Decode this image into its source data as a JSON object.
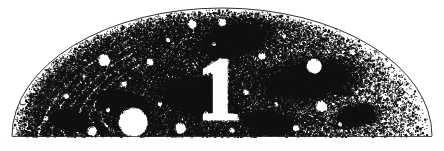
{
  "figure": {
    "kind": "half-disc-stipple-engraving",
    "label": "1",
    "label_style": "serif-numeral-white-knockout",
    "corner_mark": "~~~",
    "background_color": "#fdfdfb",
    "ink_color": "#111111",
    "paper_color": "#ffffff",
    "canvas": {
      "width": 444,
      "height": 151
    }
  },
  "chart_data": {
    "type": "scatter",
    "title": "",
    "xlabel": "",
    "ylabel": "",
    "grid": false,
    "legend": null,
    "xlim": [
      0,
      444
    ],
    "ylim": [
      0,
      151
    ],
    "shape": {
      "type": "half-disc",
      "center_x": 222,
      "baseline_y": 136,
      "radius_x": 210,
      "radius_y": 128,
      "outline_stroke": "#1a1a1a",
      "outline_width": 0.9
    },
    "density_field": {
      "description": "Ink coverage fraction by normalized horizontal position across the plate",
      "x": [
        0.0,
        0.1,
        0.2,
        0.3,
        0.4,
        0.5,
        0.6,
        0.7,
        0.8,
        0.9,
        1.0
      ],
      "values": [
        0.62,
        0.78,
        0.86,
        0.9,
        0.88,
        0.8,
        0.66,
        0.5,
        0.33,
        0.18,
        0.07
      ]
    },
    "swirl_bands": {
      "description": "Concentric lens-shaped arc bands in the upper-left quadrant",
      "count": 6,
      "origin_x": 150,
      "origin_y": 96,
      "rotation_deg": -29,
      "radii": [
        44,
        58,
        72,
        86,
        100,
        114
      ],
      "band_width": 6.5,
      "arc_start_deg": 150,
      "arc_end_deg": 268
    },
    "dark_lobes": [
      {
        "cx": 232,
        "cy": 40,
        "rx": 40,
        "ry": 19,
        "rot": -12
      },
      {
        "cx": 196,
        "cy": 96,
        "rx": 44,
        "ry": 22,
        "rot": 8
      },
      {
        "cx": 306,
        "cy": 80,
        "rx": 52,
        "ry": 21,
        "rot": -7
      },
      {
        "cx": 122,
        "cy": 104,
        "rx": 34,
        "ry": 17,
        "rot": 16
      },
      {
        "cx": 268,
        "cy": 122,
        "rx": 30,
        "ry": 13,
        "rot": 5
      },
      {
        "cx": 356,
        "cy": 116,
        "rx": 22,
        "ry": 11,
        "rot": -9
      },
      {
        "cx": 70,
        "cy": 120,
        "rx": 26,
        "ry": 12,
        "rot": 12
      }
    ],
    "white_discs": [
      {
        "cx": 133,
        "cy": 122,
        "r": 14.5
      },
      {
        "cx": 314,
        "cy": 66,
        "r": 7.5
      },
      {
        "cx": 104,
        "cy": 60,
        "r": 6.0
      },
      {
        "cx": 180,
        "cy": 128,
        "r": 5.5
      },
      {
        "cx": 321,
        "cy": 106,
        "r": 5.5
      },
      {
        "cx": 192,
        "cy": 24,
        "r": 4.5
      },
      {
        "cx": 222,
        "cy": 22,
        "r": 4.0
      },
      {
        "cx": 92,
        "cy": 131,
        "r": 4.8
      },
      {
        "cx": 262,
        "cy": 56,
        "r": 3.6
      },
      {
        "cx": 150,
        "cy": 62,
        "r": 3.4
      },
      {
        "cx": 352,
        "cy": 52,
        "r": 3.0
      },
      {
        "cx": 246,
        "cy": 92,
        "r": 2.8
      },
      {
        "cx": 296,
        "cy": 128,
        "r": 3.2
      },
      {
        "cx": 66,
        "cy": 96,
        "r": 2.6
      },
      {
        "cx": 206,
        "cy": 114,
        "r": 2.4
      },
      {
        "cx": 168,
        "cy": 40,
        "r": 2.2
      },
      {
        "cx": 124,
        "cy": 84,
        "r": 2.6
      },
      {
        "cx": 284,
        "cy": 36,
        "r": 2.2
      },
      {
        "cx": 372,
        "cy": 88,
        "r": 2.4
      },
      {
        "cx": 46,
        "cy": 118,
        "r": 2.0
      },
      {
        "cx": 232,
        "cy": 130,
        "r": 2.6
      },
      {
        "cx": 160,
        "cy": 104,
        "r": 2.2
      },
      {
        "cx": 340,
        "cy": 124,
        "r": 2.0
      },
      {
        "cx": 108,
        "cy": 110,
        "r": 2.2
      },
      {
        "cx": 276,
        "cy": 104,
        "r": 1.9
      },
      {
        "cx": 214,
        "cy": 44,
        "r": 1.8
      },
      {
        "cx": 388,
        "cy": 112,
        "r": 1.7
      },
      {
        "cx": 84,
        "cy": 76,
        "r": 1.8
      }
    ],
    "numeral": {
      "text": "1",
      "x": 219,
      "y": 118,
      "height": 62,
      "color": "#ffffff"
    }
  }
}
